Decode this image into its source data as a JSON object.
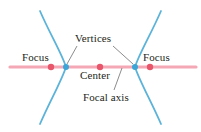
{
  "figure": {
    "labels": {
      "focus_left": "Focus",
      "focus_right": "Focus",
      "vertices": "Vertices",
      "center": "Center",
      "focal_axis": "Focal axis"
    },
    "colors": {
      "curve": "#5cb3d9",
      "axis": "#f4a7b4",
      "focus_point": "#e8566b",
      "center_point": "#e8566b",
      "vertex_point": "#3aa5d6",
      "leader_line": "#6d6e71",
      "text": "#231f20",
      "background": "#ffffff"
    },
    "geometry": {
      "width": 201,
      "height": 132,
      "axis_y": 67,
      "axis_x_start": 10,
      "axis_x_end": 196,
      "center_x": 100,
      "focus_left_x": 51,
      "focus_right_x": 150,
      "vertex_left_x": 66,
      "vertex_right_x": 135,
      "point_radius": 3.2,
      "vertex_radius": 3.0
    }
  }
}
